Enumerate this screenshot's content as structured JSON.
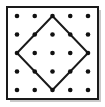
{
  "figure": {
    "canvas": {
      "width": 105,
      "height": 107,
      "background": "#ffffff"
    },
    "frame": {
      "name": "square-border",
      "x": 7,
      "y": 7,
      "width": 91,
      "height": 92,
      "stroke": "#1a1a1a",
      "stroke_width": 2,
      "fill": "#ffffff"
    },
    "shadow": {
      "name": "drop-shadow",
      "x": 10,
      "y": 10,
      "width": 91,
      "height": 92,
      "color": "#c9c9c9"
    },
    "grid": {
      "name": "dot-grid",
      "rows": 5,
      "cols": 5,
      "dot_radius": 2.3,
      "dot_color": "#111111",
      "x_positions": [
        17,
        34.75,
        52.5,
        70.25,
        88
      ],
      "y_positions": [
        16,
        34.5,
        53,
        71.5,
        90
      ]
    },
    "diamond": {
      "name": "inscribed-diamond",
      "stroke": "#1a1a1a",
      "stroke_width": 2,
      "fill": "none",
      "vertices": [
        {
          "label": "top",
          "x": 52.5,
          "y": 16
        },
        {
          "label": "right",
          "x": 88,
          "y": 53
        },
        {
          "label": "bottom",
          "x": 52.5,
          "y": 90
        },
        {
          "label": "left",
          "x": 17,
          "y": 53
        }
      ],
      "points_string": "52.5,16 88,53 52.5,90 17,53"
    }
  }
}
